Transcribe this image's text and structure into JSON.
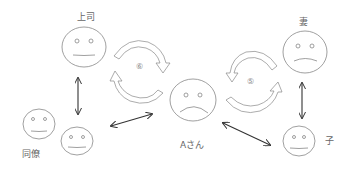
{
  "diagram": {
    "type": "relationship-diagram",
    "colors": {
      "stroke": "#888888",
      "arrow": "#333333",
      "text": "#666666",
      "background": "#ffffff"
    },
    "nodes": [
      {
        "id": "boss",
        "label": "上司",
        "expression": "neutral"
      },
      {
        "id": "wife",
        "label": "妻",
        "expression": "frown"
      },
      {
        "id": "a_san",
        "label": "Aさん",
        "expression": "frown"
      },
      {
        "id": "coworkers",
        "label": "同僚",
        "expression": "neutral",
        "count": 2
      },
      {
        "id": "child",
        "label": "子",
        "expression": "neutral"
      }
    ],
    "cycles": [
      {
        "id": "cycle_boss",
        "between": [
          "boss",
          "a_san"
        ],
        "label": "⑥"
      },
      {
        "id": "cycle_wife",
        "between": [
          "wife",
          "a_san"
        ],
        "label": "⑤"
      }
    ],
    "edges": [
      {
        "from": "boss",
        "to": "coworkers",
        "style": "double-arrow"
      },
      {
        "from": "coworkers",
        "to": "a_san",
        "style": "double-arrow"
      },
      {
        "from": "a_san",
        "to": "child",
        "style": "double-arrow"
      },
      {
        "from": "wife",
        "to": "child",
        "style": "double-arrow"
      }
    ]
  }
}
